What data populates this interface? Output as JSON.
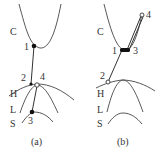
{
  "panels": [
    {
      "caption": "(a)",
      "curve_labels": {
        "C": "C",
        "H": "H",
        "L": "L",
        "S": "S"
      },
      "point_labels": {
        "p1": "1",
        "p2": "2",
        "p3": "3",
        "p4": "4"
      },
      "points": {
        "p1": "filled",
        "p2": "filled",
        "p3": "filled",
        "p4": "open"
      }
    },
    {
      "caption": "(b)",
      "curve_labels": {
        "C": "C",
        "H": "H",
        "L": "L",
        "S": "S"
      },
      "point_labels": {
        "p1": "1",
        "p2": "2",
        "p3": "3",
        "p4": "4"
      },
      "points": {
        "p1": "filled",
        "p2": "open",
        "p3": "filled",
        "p4": "open"
      }
    }
  ]
}
